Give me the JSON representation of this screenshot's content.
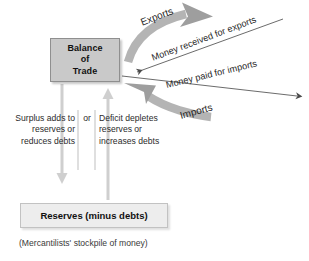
{
  "figure": {
    "boxes": {
      "balance_of_trade": {
        "line1": "Balance",
        "line2": "of",
        "line3": "Trade",
        "fill_color": "#c9c9c9",
        "border_color": "#8f8f8f"
      },
      "reserves": {
        "label": "Reserves (minus debts)",
        "fill_color": "#ededed",
        "border_color": "#c2c2c2"
      }
    },
    "caption": "(Mercantilists' stockpile of money)",
    "columns": {
      "surplus": "Surplus adds to reserves or reduces debts",
      "conjunction": "or",
      "deficit": "Deficit depletes reserves or increases debts"
    },
    "flows": [
      {
        "label": "Exports",
        "style": "thick-gray-curved-arrow",
        "direction": "outward-right-up",
        "color": "#a8a8a8"
      },
      {
        "label": "Money received for exports",
        "style": "thin-line-arrow",
        "direction": "inward-left-down",
        "color": "#555555"
      },
      {
        "label": "Money paid for imports",
        "style": "thin-line-arrow",
        "direction": "outward-right-down",
        "color": "#555555"
      },
      {
        "label": "Imports",
        "style": "thick-gray-curved-arrow",
        "direction": "inward-left-up",
        "color": "#a8a8a8"
      }
    ],
    "connectors": [
      {
        "name": "surplus-down-arrow",
        "direction": "down",
        "from": "balance-of-trade",
        "to": "reserves",
        "color": "#cccccc"
      },
      {
        "name": "deficit-up-arrow",
        "direction": "up",
        "from": "reserves",
        "to": "balance-of-trade",
        "color": "#cccccc"
      }
    ]
  }
}
